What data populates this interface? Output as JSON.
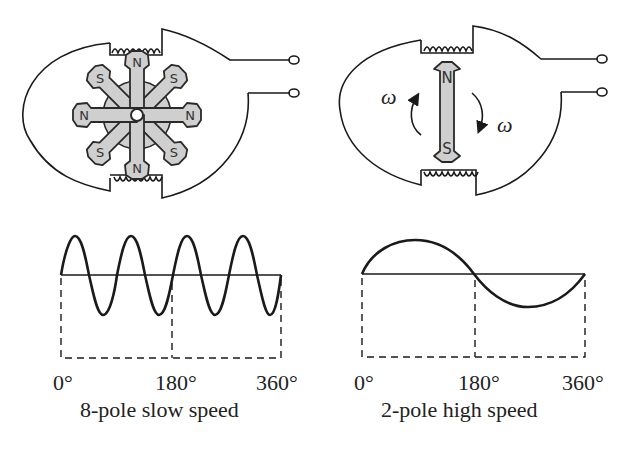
{
  "left_panel": {
    "rotor_poles": [
      {
        "label": "N",
        "angle": 0
      },
      {
        "label": "S",
        "angle": 45
      },
      {
        "label": "N",
        "angle": 90
      },
      {
        "label": "S",
        "angle": 135
      },
      {
        "label": "N",
        "angle": 180
      },
      {
        "label": "S",
        "angle": 225
      },
      {
        "label": "N",
        "angle": 270
      },
      {
        "label": "S",
        "angle": 315
      }
    ],
    "tick_labels": [
      "0°",
      "180°",
      "360°"
    ],
    "caption": "8-pole slow speed",
    "cycles": 4
  },
  "right_panel": {
    "magnet_top": "N",
    "magnet_bottom": "S",
    "omega_left": "ω",
    "omega_right": "ω",
    "tick_labels": [
      "0°",
      "180°",
      "360°"
    ],
    "caption": "2-pole high speed",
    "cycles": 1
  },
  "colors": {
    "stroke": "#1a1a1a",
    "pole_fill": "#cfcfcf"
  }
}
